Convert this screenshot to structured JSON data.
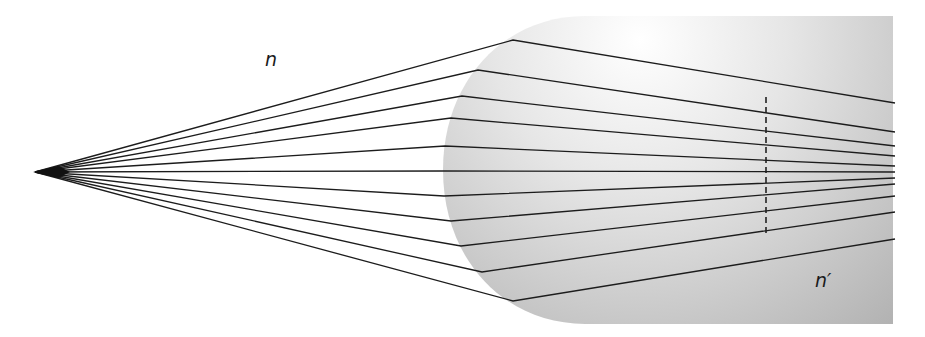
{
  "diagram": {
    "labels": {
      "incident_medium": "n",
      "refracting_medium": "n′"
    },
    "colors": {
      "background": "#ffffff",
      "medium_light": "#fbfbfb",
      "medium_dark": "#a8a8a8",
      "ray": "#1c1c1c",
      "dashed_line": "#222222"
    },
    "source_point": {
      "x": 35,
      "y": 172
    },
    "medium": {
      "top_y": 16,
      "bottom_y": 324,
      "right_x": 893,
      "vertex_x": 443,
      "top_corner_x": 585,
      "bottom_corner_x": 585
    },
    "paraxial_focus_line": {
      "x": 766,
      "y1": 97,
      "y2": 236,
      "style": "dashed"
    },
    "rays": [
      {
        "hit": [
          513,
          40
        ],
        "exit": [
          895,
          103
        ]
      },
      {
        "hit": [
          478,
          70
        ],
        "exit": [
          895,
          132
        ]
      },
      {
        "hit": [
          462,
          96
        ],
        "exit": [
          895,
          146
        ]
      },
      {
        "hit": [
          451,
          118
        ],
        "exit": [
          895,
          156
        ]
      },
      {
        "hit": [
          445,
          146
        ],
        "exit": [
          895,
          166
        ]
      },
      {
        "hit": [
          443,
          171
        ],
        "exit": [
          895,
          172
        ]
      },
      {
        "hit": [
          444,
          196
        ],
        "exit": [
          895,
          178
        ]
      },
      {
        "hit": [
          451,
          221
        ],
        "exit": [
          895,
          184
        ]
      },
      {
        "hit": [
          461,
          246
        ],
        "exit": [
          895,
          196
        ]
      },
      {
        "hit": [
          482,
          272
        ],
        "exit": [
          895,
          212
        ]
      },
      {
        "hit": [
          513,
          301
        ],
        "exit": [
          895,
          239
        ]
      }
    ]
  }
}
